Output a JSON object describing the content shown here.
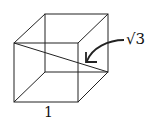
{
  "diagram": {
    "type": "unit-cube-space-diagonal",
    "edge_label": "1",
    "diagonal_label": "√3",
    "vertices": {
      "front_top_left": [
        14,
        43
      ],
      "front_top_right": [
        78,
        43
      ],
      "front_bottom_left": [
        14,
        102
      ],
      "front_bottom_right": [
        78,
        102
      ],
      "back_top_left": [
        45,
        14
      ],
      "back_top_right": [
        108,
        14
      ],
      "back_bottom_left": [
        45,
        72
      ],
      "back_bottom_right": [
        108,
        72
      ]
    },
    "colors": {
      "line": "#222222",
      "background": "#ffffff"
    }
  }
}
